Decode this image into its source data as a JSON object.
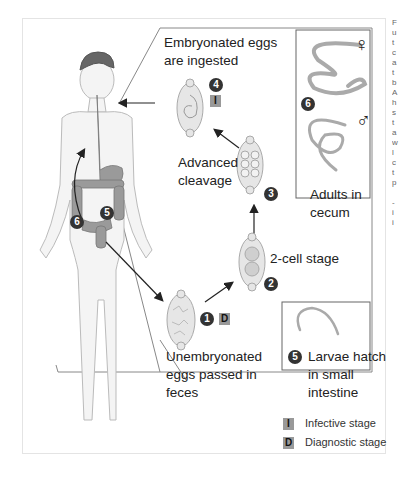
{
  "diagram": {
    "title_hint": "Trichuris trichiura life cycle",
    "steps": [
      {
        "number": "1",
        "label_lines": [
          "Unembryonated",
          "eggs passed in",
          "feces"
        ],
        "stage_tag": "D"
      },
      {
        "number": "2",
        "label_lines": [
          "2-cell stage"
        ]
      },
      {
        "number": "3",
        "label_lines": [
          "Advanced",
          "cleavage"
        ]
      },
      {
        "number": "4",
        "label_lines": [
          "Embryonated eggs",
          "are ingested"
        ],
        "stage_tag": "I"
      },
      {
        "number": "5",
        "label_lines": [
          "Larvae hatch",
          "in small",
          "intestine"
        ]
      },
      {
        "number": "6",
        "label_lines": [
          "Adults in",
          "cecum"
        ]
      }
    ],
    "host_badges": {
      "five": "5",
      "six": "6"
    },
    "sex_symbols": {
      "female": "♀",
      "male": "♂"
    },
    "legend": [
      {
        "tag": "I",
        "label": "Infective stage"
      },
      {
        "tag": "D",
        "label": "Diagnostic stage"
      }
    ],
    "side_text_fragment": "F\nu\nt\nc\na\nt\nb\nA\nh\ns\nt\na\nw\nl\nc\nt\np\n\n-\ni\ni"
  },
  "colors": {
    "badge": "#333333",
    "stage_box": "#999999",
    "body_outline": "#bbbbbb",
    "organ": "#8a8a8a",
    "egg_fill": "#e6e6e6"
  }
}
